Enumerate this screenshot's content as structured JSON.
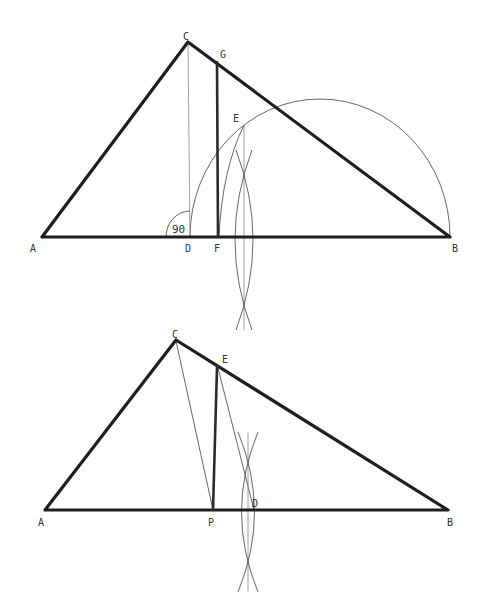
{
  "figures": [
    {
      "id": "top",
      "description": "Triangle ABC with altitude CD, perpendicular FG, semicircle on DB and construction arcs",
      "labels": {
        "A": "A",
        "B": "B",
        "C": "C",
        "D": "D",
        "E": "E",
        "F": "F",
        "G": "G",
        "angle": "90"
      },
      "points": {
        "A": [
          42,
          237
        ],
        "B": [
          450,
          237
        ],
        "C": [
          188,
          42
        ],
        "D": [
          190,
          237
        ],
        "F": [
          218,
          237
        ],
        "G": [
          217,
          61
        ],
        "E": [
          244,
          125
        ]
      }
    },
    {
      "id": "bottom",
      "description": "Triangle ABC with segment PE, line CP, ED and perpendicular-bisector construction arcs at D",
      "labels": {
        "A": "A",
        "B": "B",
        "C": "C",
        "D": "D",
        "E": "E",
        "P": "P"
      },
      "points": {
        "A": [
          45,
          510
        ],
        "B": [
          448,
          510
        ],
        "C": [
          176,
          340
        ],
        "E": [
          217,
          367
        ],
        "P": [
          213,
          510
        ],
        "D": [
          254,
          510
        ]
      }
    }
  ],
  "colors": {
    "ink": "#1e1e1e",
    "construction": "#555555",
    "background": "#ffffff"
  }
}
